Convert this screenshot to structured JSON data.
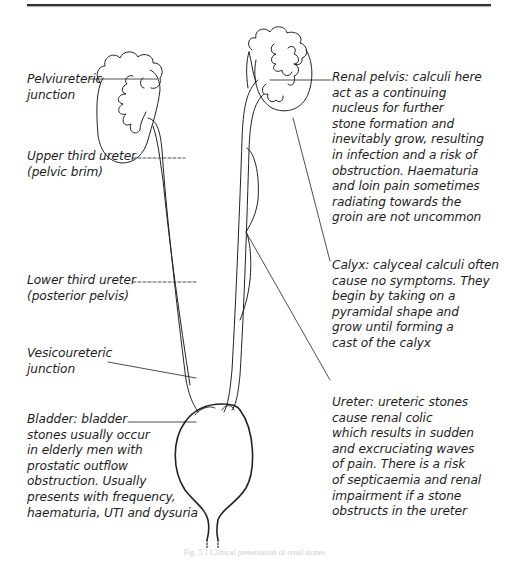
{
  "figure": {
    "caption": "Fig. 5.1  Clinical presentation of renal stones",
    "line_color": "#222222",
    "labels": {
      "pelviureteric_junction": "Pelviureteric\njunction",
      "upper_third_ureter": "Upper third ureter\n(pelvic brim)",
      "lower_third_ureter": "Lower third ureter\n(posterior pelvis)",
      "vesicoureteric_junction": "Vesicoureteric\njunction",
      "bladder": "Bladder: bladder\nstones usually occur\nin elderly men with\nprostatic outflow\nobstruction. Usually\npresents with frequency,\nhaematuria, UTI and dysuria",
      "renal_pelvis": "Renal pelvis: calculi here\nact as a continuing\nnucleus for further\nstone formation and\ninevitably grow, resulting\nin infection and a risk of\nobstruction. Haematuria\nand loin pain sometimes\nradiating towards the\ngroin are not uncommon",
      "calyx": "Calyx: calyceal calculi often\ncause no symptoms. They\nbegin by taking on a\npyramidal shape and\ngrow until forming a\ncast of the calyx",
      "ureter": "Ureter: ureteric stones\ncause renal colic\nwhich results in sudden\nand excruciating waves\nof pain. There is a risk\nof septicaemia and renal\nimpairment if a stone\nobstructs in the ureter"
    }
  }
}
